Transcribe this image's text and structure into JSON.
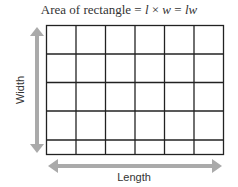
{
  "title": {
    "prefix": "Area of rectangle",
    "eq1": " = ",
    "l": "l",
    "times": " × ",
    "w": "w",
    "eq2": " = ",
    "lw": "lw"
  },
  "labels": {
    "width": "Width",
    "length": "Length"
  },
  "grid": {
    "columns": 6,
    "rows": 5,
    "line_color": "#222222"
  },
  "colors": {
    "arrow": "#aaaaaa",
    "text": "#333333"
  }
}
